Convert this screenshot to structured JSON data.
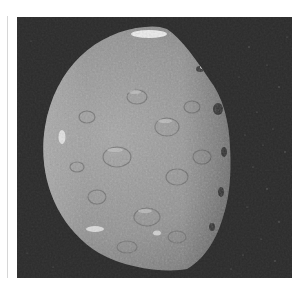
{
  "image": {
    "alt": "Grayscale spacecraft photograph of a heavily cratered moon, lit from the left, against a dark starry background",
    "subject": "cratered moon (half-lit disk)",
    "colors": {
      "background_sky": "#2c2c2c",
      "surface_light": "#b4b4b4",
      "surface_mid": "#8e8e8e",
      "surface_dark": "#5a5a5a",
      "highlight": "#e8e8e8",
      "page_background": "#ffffff",
      "divider_line": "#d6d6d6"
    }
  }
}
